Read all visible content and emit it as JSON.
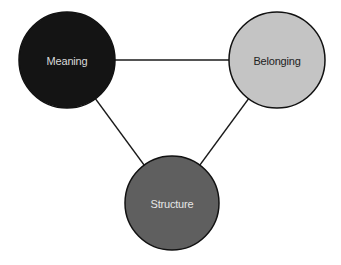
{
  "diagram": {
    "type": "triangle-relationship",
    "nodes": [
      {
        "id": "meaning",
        "label": "Meaning",
        "fill": "#141414",
        "text_color": "#d9d9d9"
      },
      {
        "id": "belonging",
        "label": "Belonging",
        "fill": "#c4c4c4",
        "text_color": "#222222"
      },
      {
        "id": "structure",
        "label": "Structure",
        "fill": "#5f5f5f",
        "text_color": "#e6e6e6"
      }
    ],
    "edges": [
      {
        "from": "meaning",
        "to": "belonging"
      },
      {
        "from": "meaning",
        "to": "structure"
      },
      {
        "from": "belonging",
        "to": "structure"
      }
    ]
  }
}
